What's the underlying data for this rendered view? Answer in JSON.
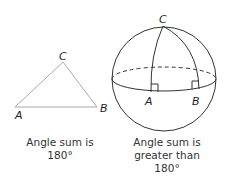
{
  "flat_triangle": {
    "vertices": {
      "A": "A",
      "B": "B",
      "C": "C"
    },
    "caption_line1": "Angle sum is",
    "caption_line2": "180°"
  },
  "spherical_triangle": {
    "vertices": {
      "A": "A",
      "B": "B",
      "C": "C"
    },
    "caption_line1": "Angle sum is",
    "caption_line2": "greater than",
    "caption_line3": "180°"
  },
  "colors": {
    "flat_line": "#aaaaaa",
    "sphere_line": "#333333"
  }
}
